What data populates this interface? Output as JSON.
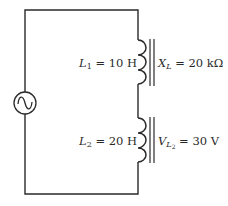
{
  "diagram": {
    "type": "circuit",
    "source": {
      "kind": "ac-voltage-source",
      "symbol": "~"
    },
    "components": [
      {
        "id": "L1",
        "label_var": "L",
        "label_sub": "1",
        "label_value": " = 10 H",
        "core": "iron",
        "annotation_var": "X",
        "annotation_sub": "L",
        "annotation_value": " = 20 kΩ"
      },
      {
        "id": "L2",
        "label_var": "L",
        "label_sub": "2",
        "label_value": " = 20 H",
        "core": "iron",
        "annotation_var": "V",
        "annotation_sub": "L",
        "annotation_subsub": "2",
        "annotation_value": " = 30 V"
      }
    ],
    "colors": {
      "wire": "#2a2a2a",
      "background": "#ffffff"
    }
  }
}
